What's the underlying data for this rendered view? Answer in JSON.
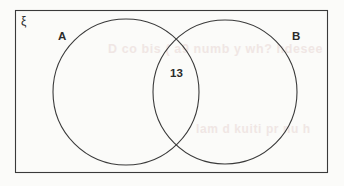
{
  "diagram": {
    "type": "venn-two-set",
    "universal_set_label": "ξ",
    "set_a_label": "A",
    "set_b_label": "B",
    "intersection_value": "13",
    "stroke_color": "#3a3a3a",
    "fill_color": "none",
    "background_color": "#fbfbf9",
    "ghost_artifacts": [
      {
        "text": "D co bis ( a9 numb y  wh? hdesee"
      },
      {
        "text": "lam  d  kuiti pr  nu h"
      }
    ]
  }
}
